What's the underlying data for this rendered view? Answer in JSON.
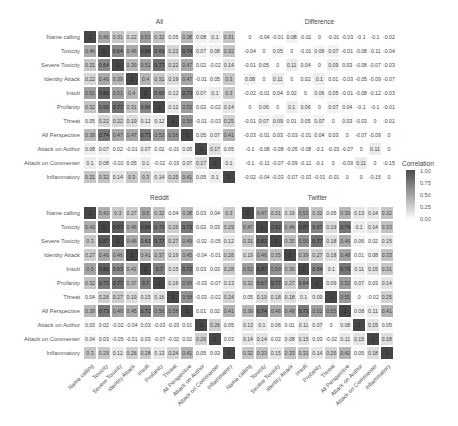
{
  "chart_data": {
    "type": "heatmap",
    "legend": {
      "title": "Correlation",
      "ticks": [
        "1.00",
        "0.75",
        "0.50",
        "0.25",
        "0.00"
      ],
      "position": "right"
    },
    "labels": [
      "Name calling",
      "Toxicity",
      "Severe Toxicity",
      "Identity Attack",
      "Insult",
      "Profanity",
      "Threat",
      "All Perspective",
      "Attack on Author",
      "Attack on Commenter",
      "Inflammatory"
    ],
    "panels": [
      {
        "title": "All",
        "values": [
          [
            1,
            0.46,
            0.31,
            0.22,
            0.51,
            0.32,
            0.05,
            0.38,
            0.08,
            0.1,
            0.31
          ],
          [
            0.46,
            1,
            0.64,
            0.46,
            0.86,
            0.69,
            0.22,
            0.74,
            0.07,
            0.08,
            0.32
          ],
          [
            0.31,
            0.64,
            1,
            0.39,
            0.51,
            0.77,
            0.22,
            0.47,
            0.02,
            -0.02,
            0.14
          ],
          [
            0.22,
            0.46,
            0.39,
            1,
            0.4,
            0.31,
            0.19,
            0.47,
            -0.01,
            0.05,
            0.3
          ],
          [
            0.51,
            0.86,
            0.51,
            0.4,
            1,
            0.66,
            0.12,
            0.73,
            0.07,
            0.1,
            0.3
          ],
          [
            0.32,
            0.69,
            0.77,
            0.31,
            0.66,
            1,
            0.12,
            0.53,
            0.02,
            -0.02,
            0.14
          ],
          [
            0.05,
            0.22,
            0.22,
            0.19,
            0.12,
            0.12,
            1,
            0.56,
            -0.01,
            -0.03,
            0.25
          ],
          [
            0.38,
            0.74,
            0.47,
            0.47,
            0.73,
            0.53,
            0.56,
            1,
            0.05,
            0.07,
            0.41
          ],
          [
            0.08,
            0.07,
            0.02,
            -0.01,
            0.07,
            0.02,
            -0.01,
            0.05,
            1,
            0.17,
            0.05
          ],
          [
            0.1,
            0.08,
            -0.02,
            0.05,
            0.1,
            -0.02,
            -0.03,
            0.07,
            0.17,
            1,
            0.1
          ],
          [
            0.31,
            0.32,
            0.14,
            0.3,
            0.3,
            0.14,
            0.25,
            0.41,
            0.05,
            0.1,
            1
          ]
        ]
      },
      {
        "title": "Difference",
        "values": [
          [
            0,
            -0.04,
            -0.01,
            0.08,
            -0.02,
            0,
            -0.01,
            -0.03,
            -0.1,
            -0.1,
            -0.02
          ],
          [
            -0.04,
            0,
            0.05,
            0,
            -0.01,
            0.06,
            0.07,
            -0.01,
            -0.08,
            -0.11,
            -0.04
          ],
          [
            -0.01,
            0.05,
            0,
            0.11,
            0.04,
            0,
            0.09,
            0.03,
            -0.08,
            -0.07,
            -0.03
          ],
          [
            0.08,
            0,
            0.11,
            0,
            0.02,
            0.1,
            0.01,
            -0.03,
            -0.05,
            -0.09,
            -0.07
          ],
          [
            -0.02,
            -0.01,
            0.04,
            0.02,
            0,
            0.06,
            0.05,
            -0.01,
            -0.08,
            -0.12,
            -0.03
          ],
          [
            0,
            0.06,
            0,
            0.1,
            0.06,
            0,
            0.07,
            0.04,
            -0.1,
            -0.1,
            -0.01
          ],
          [
            -0.01,
            0.07,
            0.09,
            0.01,
            0.05,
            0.07,
            0,
            0.03,
            -0.03,
            0,
            -0.01
          ],
          [
            -0.03,
            -0.01,
            0.03,
            -0.03,
            -0.01,
            0.04,
            0.03,
            0,
            -0.07,
            -0.09,
            0
          ],
          [
            -0.1,
            -0.08,
            -0.08,
            -0.05,
            -0.08,
            -0.1,
            -0.03,
            -0.07,
            0,
            0.11,
            0
          ],
          [
            -0.1,
            -0.11,
            -0.07,
            -0.09,
            -0.12,
            -0.1,
            0,
            -0.09,
            0.11,
            0,
            -0.15
          ],
          [
            -0.02,
            -0.04,
            -0.03,
            -0.07,
            -0.03,
            -0.01,
            -0.01,
            0,
            0,
            -0.15,
            0
          ]
        ]
      },
      {
        "title": "Reddit",
        "values": [
          [
            1,
            0.43,
            0.3,
            0.27,
            0.5,
            0.32,
            0.04,
            0.38,
            0.03,
            0.04,
            0.3
          ],
          [
            0.43,
            1,
            0.87,
            0.46,
            0.86,
            0.73,
            0.26,
            0.73,
            0.02,
            0.03,
            0.29
          ],
          [
            0.3,
            0.87,
            1,
            0.46,
            0.63,
            0.77,
            0.27,
            0.49,
            -0.02,
            -0.05,
            0.12
          ],
          [
            0.27,
            0.46,
            0.46,
            1,
            0.41,
            0.37,
            0.19,
            0.45,
            -0.04,
            -0.01,
            0.26
          ],
          [
            0.5,
            0.86,
            0.63,
            0.41,
            1,
            0.7,
            0.15,
            0.72,
            0.03,
            0.03,
            0.28
          ],
          [
            0.32,
            0.73,
            0.77,
            0.37,
            0.7,
            1,
            0.16,
            0.56,
            -0.03,
            -0.07,
            0.13
          ],
          [
            0.04,
            0.26,
            0.27,
            0.19,
            0.15,
            0.16,
            1,
            0.58,
            -0.03,
            -0.02,
            0.24
          ],
          [
            0.38,
            0.73,
            0.49,
            0.45,
            0.72,
            0.56,
            0.58,
            1,
            0.01,
            0.02,
            0.41
          ],
          [
            0.03,
            0.02,
            -0.02,
            -0.04,
            0.03,
            -0.03,
            -0.03,
            0.01,
            1,
            0.26,
            0.05
          ],
          [
            0.04,
            0.03,
            -0.05,
            -0.01,
            0.03,
            -0.07,
            -0.02,
            0.02,
            0.26,
            1,
            0.03
          ],
          [
            0.3,
            0.29,
            0.12,
            0.26,
            0.28,
            0.13,
            0.24,
            0.41,
            0.05,
            0.03,
            1
          ]
        ]
      },
      {
        "title": "Twitter",
        "values": [
          [
            1,
            0.47,
            0.31,
            0.19,
            0.52,
            0.32,
            0.05,
            0.39,
            0.13,
            0.14,
            0.32
          ],
          [
            0.47,
            1,
            0.82,
            0.46,
            0.87,
            0.67,
            0.19,
            0.74,
            0.1,
            0.14,
            0.33
          ],
          [
            0.31,
            0.82,
            1,
            0.35,
            0.59,
            0.77,
            0.18,
            0.46,
            0.06,
            0.02,
            0.15
          ],
          [
            0.19,
            0.46,
            0.35,
            1,
            0.39,
            0.27,
            0.18,
            0.48,
            0.01,
            0.08,
            0.33
          ],
          [
            0.52,
            0.87,
            0.59,
            0.39,
            1,
            0.64,
            0.1,
            0.73,
            0.11,
            0.15,
            0.31
          ],
          [
            0.32,
            0.67,
            0.77,
            0.27,
            0.64,
            1,
            0.09,
            0.52,
            0.07,
            0.03,
            0.14
          ],
          [
            0.05,
            0.19,
            0.18,
            0.18,
            0.1,
            0.09,
            1,
            0.55,
            0,
            -0.02,
            0.25
          ],
          [
            0.39,
            0.74,
            0.46,
            0.48,
            0.73,
            0.52,
            0.55,
            1,
            0.08,
            0.11,
            0.41
          ],
          [
            0.13,
            0.1,
            0.06,
            0.01,
            0.11,
            0.07,
            0,
            0.08,
            1,
            0.15,
            0.05
          ],
          [
            0.14,
            0.14,
            0.02,
            0.08,
            0.15,
            0.03,
            -0.02,
            0.11,
            0.15,
            1,
            0.18
          ],
          [
            0.32,
            0.33,
            0.15,
            0.33,
            0.31,
            0.14,
            0.25,
            0.41,
            0.05,
            0.18,
            1
          ]
        ]
      }
    ]
  }
}
